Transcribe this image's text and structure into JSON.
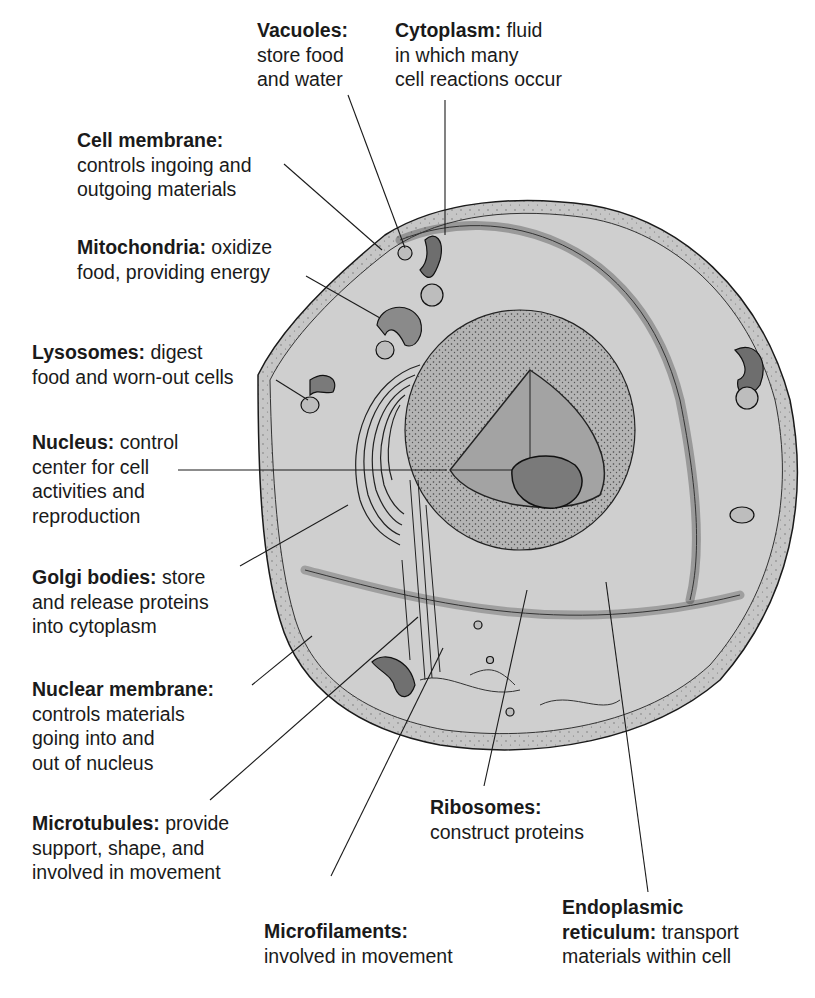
{
  "diagram": {
    "colors": {
      "background": "#ffffff",
      "cytoplasm": "#c9c9c9",
      "cell_edge": "#9a9a9a",
      "nucleus_cut": "#a8a8a8",
      "organelle_dark": "#7d7d7d",
      "ink": "#1a1a1a"
    }
  },
  "labels": [
    {
      "id": "vacuoles",
      "term": "Vacuoles:",
      "lines": [
        "",
        "store food",
        "and water"
      ]
    },
    {
      "id": "cytoplasm",
      "term": "Cytoplasm:",
      "rest": " fluid",
      "lines": [
        "",
        "in which many",
        "cell reactions occur"
      ]
    },
    {
      "id": "cell-membrane",
      "term": "Cell membrane:",
      "lines": [
        "",
        "controls ingoing and",
        "outgoing materials"
      ]
    },
    {
      "id": "mitochondria",
      "term": "Mitochondria:",
      "rest": " oxidize",
      "lines": [
        "",
        "food, providing energy"
      ]
    },
    {
      "id": "lysosomes",
      "term": "Lysosomes:",
      "rest": " digest",
      "lines": [
        "",
        "food and worn-out cells"
      ]
    },
    {
      "id": "nucleus",
      "term": "Nucleus:",
      "rest": " control",
      "lines": [
        "",
        "center for cell",
        "activities and",
        "reproduction"
      ]
    },
    {
      "id": "golgi-bodies",
      "term": "Golgi bodies:",
      "rest": " store",
      "lines": [
        "",
        "and release proteins",
        "into cytoplasm"
      ]
    },
    {
      "id": "nuclear-membrane",
      "term": "Nuclear membrane:",
      "lines": [
        "",
        "controls materials",
        "going into and",
        "out of nucleus"
      ]
    },
    {
      "id": "microtubules",
      "term": "Microtubules:",
      "rest": " provide",
      "lines": [
        "",
        "support, shape, and",
        "involved in movement"
      ]
    },
    {
      "id": "microfilaments",
      "term": "Microfilaments:",
      "lines": [
        "",
        "involved in movement"
      ]
    },
    {
      "id": "ribosomes",
      "term": "Ribosomes:",
      "lines": [
        "",
        "construct proteins"
      ]
    },
    {
      "id": "endoplasmic-reticulum",
      "term": "Endoplasmic",
      "lines": [
        "",
        "reticulum: transport",
        "materials within cell"
      ],
      "term2": "reticulum:",
      "rest2": " transport"
    }
  ]
}
